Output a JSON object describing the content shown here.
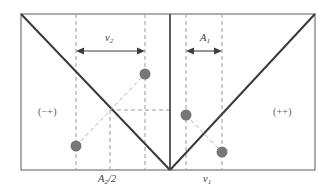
{
  "figure": {
    "background_color": "#ffffff",
    "frame": {
      "stroke_color": "#777777",
      "x0": 21,
      "y0": 14,
      "x1": 315,
      "y1": 170
    },
    "divider": {
      "name": "center-divider",
      "stroke_color": "#4a4a4a",
      "x": 170
    },
    "diagonals": {
      "stroke_color": "#3a3a3a",
      "left_label": "descending-diagonal",
      "right_label": "ascending-diagonal"
    },
    "guides": {
      "stroke_color": "#9a9a9a",
      "vertical_x": [
        76,
        110,
        145,
        186,
        222
      ],
      "horizontal_y": 110
    },
    "markers": {
      "fill_color": "#777777",
      "radius": 5.5,
      "points": [
        {
          "name": "particle-upper-left-panel",
          "x": 145,
          "y": 74
        },
        {
          "name": "particle-lower-left-panel",
          "x": 76,
          "y": 146
        },
        {
          "name": "particle-upper-right-panel",
          "x": 186,
          "y": 115
        },
        {
          "name": "particle-lower-right-panel",
          "x": 222,
          "y": 152
        }
      ],
      "connectors": [
        {
          "name": "connector-left-pair",
          "x1": 76,
          "y1": 146,
          "x2": 145,
          "y2": 74
        },
        {
          "name": "connector-right-pair",
          "x1": 186,
          "y1": 115,
          "x2": 222,
          "y2": 152
        }
      ]
    },
    "measures": [
      {
        "name": "nu2-span",
        "label": "ν",
        "subscript": "2",
        "y": 51,
        "x_start": 76,
        "x_end": 145,
        "label_x": 105,
        "label_y": 33
      },
      {
        "name": "A1-span",
        "label": "A",
        "subscript": "1",
        "y": 51,
        "x_start": 186,
        "x_end": 222,
        "label_x": 200,
        "label_y": 33
      }
    ],
    "quadrant_labels": [
      {
        "name": "quadrant-label-minus-plus",
        "text": "(−+)",
        "x": 38,
        "y": 107
      },
      {
        "name": "quadrant-label-plus-plus",
        "text": "(++)",
        "x": 273,
        "y": 107
      }
    ],
    "axis_labels": [
      {
        "name": "axis-label-A2-over-2",
        "base": "A",
        "subscript": "2",
        "suffix": "/2",
        "x": 98,
        "y": 174
      },
      {
        "name": "axis-label-nu1",
        "base": "ν",
        "subscript": "1",
        "suffix": "",
        "x": 203,
        "y": 174
      }
    ]
  }
}
